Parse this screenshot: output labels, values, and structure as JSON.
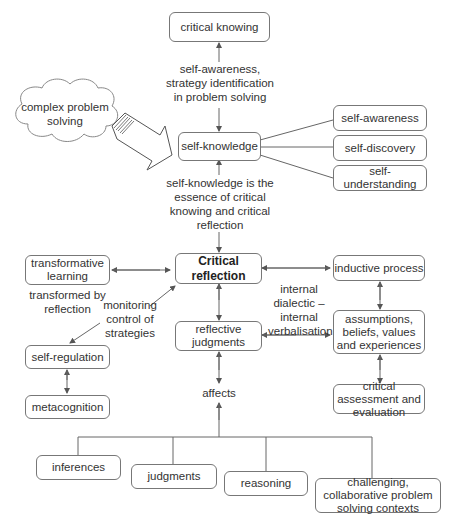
{
  "diagram": {
    "nodes": {
      "critical_knowing": "critical knowing",
      "complex_problem_solving": "complex problem solving",
      "self_knowledge": "self-knowledge",
      "self_awareness": "self-awareness",
      "self_discovery": "self-discovery",
      "self_understanding": "self-understanding",
      "transformative_learning": "transformative learning",
      "critical_reflection": "Critical reflection",
      "inductive_process": "inductive process",
      "reflective_judgments": "reflective judgments",
      "assumptions": "assumptions, beliefs, values and experiences",
      "self_regulation": "self-regulation",
      "metacognition": "metacognition",
      "critical_assessment": "critical assessment and evaluation",
      "inferences": "inferences",
      "judgments": "judgments",
      "reasoning": "reasoning",
      "challenging_contexts": "challenging, collaborative problem solving contexts"
    },
    "edge_labels": {
      "strategy_identification": "self-awareness, strategy identification in problem solving",
      "essence": "self-knowledge is the essence of critical knowing and critical reflection",
      "transformed_by_reflection": "transformed by reflection",
      "monitoring_control": "monitoring control of strategies",
      "internal_dialectic": "internal dialectic – internal verbalisation",
      "affects": "affects"
    }
  }
}
